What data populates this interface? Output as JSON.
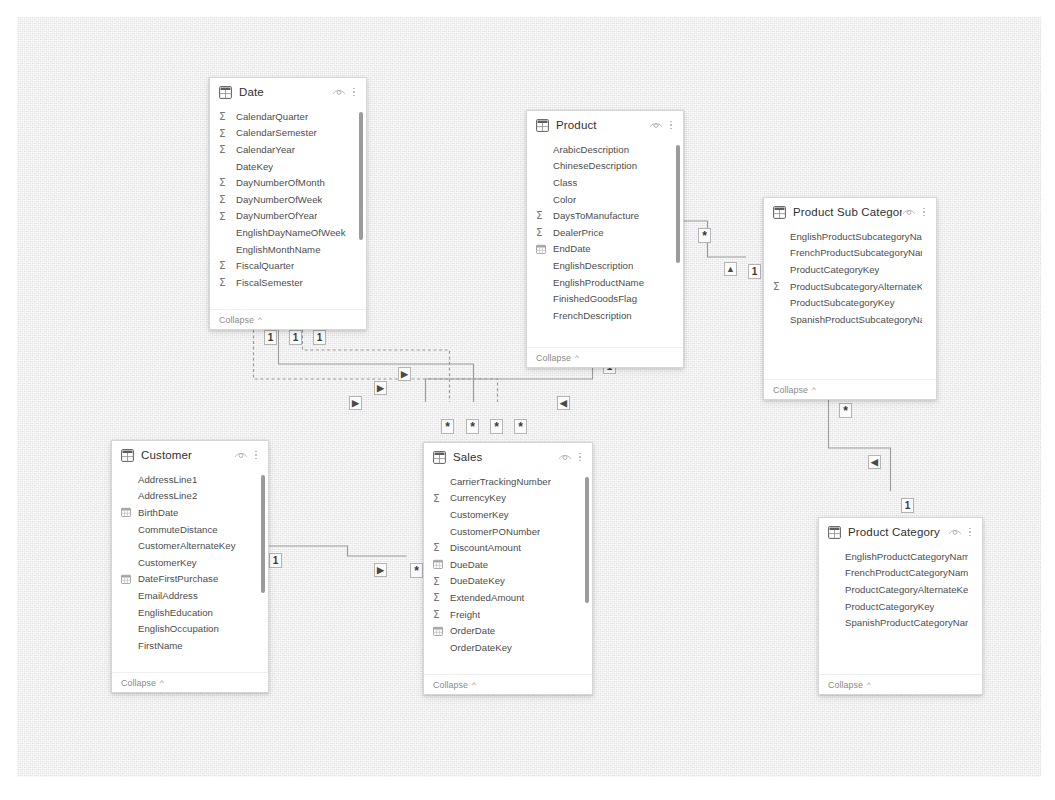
{
  "canvas": {
    "background_color": "#e9e9e9",
    "border_color": "#ffffff"
  },
  "icons": {
    "table": "table-icon",
    "hide": "eye-icon",
    "menu": "kebab-menu-icon",
    "numeric": "sigma-icon",
    "date": "calendar-icon",
    "chevron": "chevron-up-icon"
  },
  "labels": {
    "collapse": "Collapse",
    "chevron": "^"
  },
  "cardinality": {
    "one": "1",
    "many": "*",
    "arrow_right": "▶",
    "arrow_left": "◀",
    "arrow_up": "▲"
  },
  "tables": [
    {
      "name": "Date",
      "x": 192,
      "y": 60,
      "w": 158,
      "h": 253,
      "scroll": {
        "top": 6,
        "height": 128
      },
      "fields": [
        {
          "label": "CalendarQuarter",
          "icon": "sigma"
        },
        {
          "label": "CalendarSemester",
          "icon": "sigma"
        },
        {
          "label": "CalendarYear",
          "icon": "sigma"
        },
        {
          "label": "DateKey",
          "icon": "none"
        },
        {
          "label": "DayNumberOfMonth",
          "icon": "sigma"
        },
        {
          "label": "DayNumberOfWeek",
          "icon": "sigma"
        },
        {
          "label": "DayNumberOfYear",
          "icon": "sigma"
        },
        {
          "label": "EnglishDayNameOfWeek",
          "icon": "none"
        },
        {
          "label": "EnglishMonthName",
          "icon": "none"
        },
        {
          "label": "FiscalQuarter",
          "icon": "sigma"
        },
        {
          "label": "FiscalSemester",
          "icon": "sigma"
        }
      ]
    },
    {
      "name": "Product",
      "x": 509,
      "y": 93,
      "w": 158,
      "h": 258,
      "scroll": {
        "top": 6,
        "height": 118
      },
      "fields": [
        {
          "label": "ArabicDescription",
          "icon": "none"
        },
        {
          "label": "ChineseDescription",
          "icon": "none"
        },
        {
          "label": "Class",
          "icon": "none"
        },
        {
          "label": "Color",
          "icon": "none"
        },
        {
          "label": "DaysToManufacture",
          "icon": "sigma"
        },
        {
          "label": "DealerPrice",
          "icon": "sigma"
        },
        {
          "label": "EndDate",
          "icon": "calendar"
        },
        {
          "label": "EnglishDescription",
          "icon": "none"
        },
        {
          "label": "EnglishProductName",
          "icon": "none"
        },
        {
          "label": "FinishedGoodsFlag",
          "icon": "none"
        },
        {
          "label": "FrenchDescription",
          "icon": "none"
        }
      ]
    },
    {
      "name": "Product Sub Category",
      "x": 746,
      "y": 180,
      "w": 174,
      "h": 203,
      "scroll": null,
      "fields": [
        {
          "label": "EnglishProductSubcategoryNa…",
          "icon": "none"
        },
        {
          "label": "FrenchProductSubcategoryName",
          "icon": "none"
        },
        {
          "label": "ProductCategoryKey",
          "icon": "none"
        },
        {
          "label": "ProductSubcategoryAlternateKey",
          "icon": "sigma"
        },
        {
          "label": "ProductSubcategoryKey",
          "icon": "none"
        },
        {
          "label": "SpanishProductSubcategoryNa…",
          "icon": "none"
        }
      ]
    },
    {
      "name": "Product Category",
      "x": 801,
      "y": 500,
      "w": 165,
      "h": 178,
      "scroll": null,
      "fields": [
        {
          "label": "EnglishProductCategoryName",
          "icon": "none"
        },
        {
          "label": "FrenchProductCategoryName",
          "icon": "none"
        },
        {
          "label": "ProductCategoryAlternateKey",
          "icon": "none"
        },
        {
          "label": "ProductCategoryKey",
          "icon": "none"
        },
        {
          "label": "SpanishProductCategoryName",
          "icon": "none"
        }
      ]
    },
    {
      "name": "Customer",
      "x": 94,
      "y": 423,
      "w": 158,
      "h": 253,
      "scroll": {
        "top": 6,
        "height": 118
      },
      "fields": [
        {
          "label": "AddressLine1",
          "icon": "none"
        },
        {
          "label": "AddressLine2",
          "icon": "none"
        },
        {
          "label": "BirthDate",
          "icon": "calendar"
        },
        {
          "label": "CommuteDistance",
          "icon": "none"
        },
        {
          "label": "CustomerAlternateKey",
          "icon": "none"
        },
        {
          "label": "CustomerKey",
          "icon": "none"
        },
        {
          "label": "DateFirstPurchase",
          "icon": "calendar"
        },
        {
          "label": "EmailAddress",
          "icon": "none"
        },
        {
          "label": "EnglishEducation",
          "icon": "none"
        },
        {
          "label": "EnglishOccupation",
          "icon": "none"
        },
        {
          "label": "FirstName",
          "icon": "none"
        }
      ]
    },
    {
      "name": "Sales",
      "x": 406,
      "y": 425,
      "w": 170,
      "h": 253,
      "scroll": {
        "top": 6,
        "height": 126
      },
      "fields": [
        {
          "label": "CarrierTrackingNumber",
          "icon": "none"
        },
        {
          "label": "CurrencyKey",
          "icon": "sigma"
        },
        {
          "label": "CustomerKey",
          "icon": "none"
        },
        {
          "label": "CustomerPONumber",
          "icon": "none"
        },
        {
          "label": "DiscountAmount",
          "icon": "sigma"
        },
        {
          "label": "DueDate",
          "icon": "calendar"
        },
        {
          "label": "DueDateKey",
          "icon": "sigma"
        },
        {
          "label": "ExtendedAmount",
          "icon": "sigma"
        },
        {
          "label": "Freight",
          "icon": "sigma"
        },
        {
          "label": "OrderDate",
          "icon": "calendar"
        },
        {
          "label": "OrderDateKey",
          "icon": "none"
        }
      ]
    }
  ],
  "relationships": [
    {
      "from": "Date",
      "to": "Sales",
      "from_card": "1",
      "to_card": "*",
      "direction": "▶"
    },
    {
      "from": "Date",
      "to": "Sales",
      "from_card": "1",
      "to_card": "*",
      "direction": "▶"
    },
    {
      "from": "Date",
      "to": "Sales",
      "from_card": "1",
      "to_card": "*",
      "direction": "▶"
    },
    {
      "from": "Customer",
      "to": "Sales",
      "from_card": "1",
      "to_card": "*",
      "direction": "▶"
    },
    {
      "from": "Product",
      "to": "Sales",
      "from_card": "1",
      "to_card": "*",
      "direction": "◀"
    },
    {
      "from": "Product",
      "to": "Product Sub Category",
      "from_card": "*",
      "to_card": "1",
      "direction": "▲"
    },
    {
      "from": "Product Sub Category",
      "to": "Product Category",
      "from_card": "*",
      "to_card": "1",
      "direction": "◀"
    }
  ],
  "markers": [
    {
      "text": "1",
      "x": 247,
      "y": 313,
      "kind": "one"
    },
    {
      "text": "1",
      "x": 272,
      "y": 313,
      "kind": "one"
    },
    {
      "text": "1",
      "x": 296,
      "y": 313,
      "kind": "one"
    },
    {
      "text": "*",
      "x": 424,
      "y": 402,
      "kind": "many"
    },
    {
      "text": "*",
      "x": 449,
      "y": 402,
      "kind": "many"
    },
    {
      "text": "*",
      "x": 473,
      "y": 402,
      "kind": "many"
    },
    {
      "text": "*",
      "x": 497,
      "y": 402,
      "kind": "many"
    },
    {
      "text": "1",
      "x": 252,
      "y": 536,
      "kind": "one"
    },
    {
      "text": "*",
      "x": 393,
      "y": 546,
      "kind": "many"
    },
    {
      "text": "1",
      "x": 586,
      "y": 342,
      "kind": "one"
    },
    {
      "text": "*",
      "x": 681,
      "y": 211,
      "kind": "many"
    },
    {
      "text": "1",
      "x": 731,
      "y": 247,
      "kind": "one"
    },
    {
      "text": "*",
      "x": 822,
      "y": 386,
      "kind": "many"
    },
    {
      "text": "1",
      "x": 884,
      "y": 481,
      "kind": "one"
    },
    {
      "text": "▶",
      "x": 381,
      "y": 350,
      "kind": "arrow"
    },
    {
      "text": "▶",
      "x": 357,
      "y": 364,
      "kind": "arrow"
    },
    {
      "text": "▶",
      "x": 332,
      "y": 379,
      "kind": "arrow"
    },
    {
      "text": "▶",
      "x": 357,
      "y": 546,
      "kind": "arrow"
    },
    {
      "text": "◀",
      "x": 540,
      "y": 379,
      "kind": "arrow"
    },
    {
      "text": "▲",
      "x": 707,
      "y": 245,
      "kind": "arrow"
    },
    {
      "text": "◀",
      "x": 851,
      "y": 438,
      "kind": "arrow"
    }
  ]
}
